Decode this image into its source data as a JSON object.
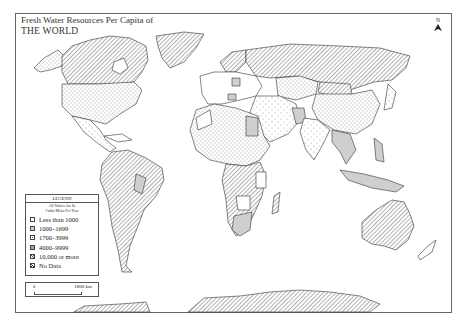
{
  "title": {
    "line1": "Fresh Water Resources Per Capita of",
    "line2": "THE WORLD"
  },
  "north_arrow": {
    "label": "N",
    "icon": "north-arrow-icon"
  },
  "legend": {
    "heading": "LEGEND",
    "subtitle_line1": "All Values Are In",
    "subtitle_line2": "Cubic Meter Per Year",
    "items": [
      {
        "label": "Less than 1000",
        "pattern": "blank",
        "fill": "#ffffff"
      },
      {
        "label": "1000–1699",
        "pattern": "solid-gray",
        "fill": "#cfcfcf"
      },
      {
        "label": "1700–3999",
        "pattern": "sparse-dots",
        "fill": "#ffffff"
      },
      {
        "label": "4000–9999",
        "pattern": "dense-dots",
        "fill": "#ffffff"
      },
      {
        "label": "10,000 or more",
        "pattern": "hatch",
        "fill": "#ffffff"
      },
      {
        "label": "No Data",
        "pattern": "hatch-bold",
        "fill": "#ffffff"
      }
    ]
  },
  "scale_bar": {
    "start": "0",
    "end": "1800 km"
  },
  "colors": {
    "frame": "#666666",
    "outline": "#444444",
    "gray_fill": "#cfcfcf",
    "hatch": "#555555"
  }
}
